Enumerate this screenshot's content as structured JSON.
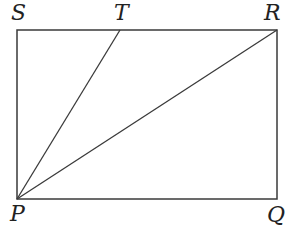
{
  "diagram": {
    "type": "geometry",
    "stroke_color": "#3a3a3a",
    "points": {
      "S": {
        "label": "S",
        "x": 17,
        "y": 30
      },
      "T": {
        "label": "T",
        "x": 120,
        "y": 30
      },
      "R": {
        "label": "R",
        "x": 277,
        "y": 30
      },
      "P": {
        "label": "P",
        "x": 17,
        "y": 199
      },
      "Q": {
        "label": "Q",
        "x": 277,
        "y": 199
      }
    },
    "segments": [
      "SR",
      "RQ",
      "QP",
      "PS",
      "PT",
      "PR"
    ]
  }
}
